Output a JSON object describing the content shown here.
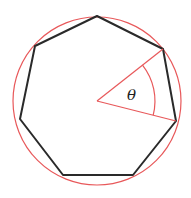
{
  "diagram": {
    "shape": "heptagon",
    "sides": 7,
    "angle_label": "θ",
    "colors": {
      "polygon": "#2a2a2a",
      "circle": "#e8585a",
      "angle": "#e8585a",
      "background": "#ffffff"
    }
  }
}
